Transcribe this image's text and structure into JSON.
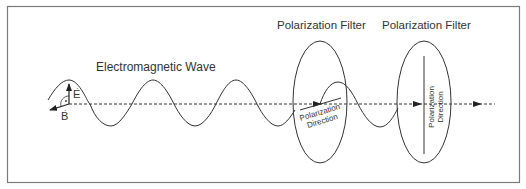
{
  "diagram": {
    "title": "Electromagnetic Wave",
    "vectors": {
      "electric": "E",
      "magnetic": "B"
    },
    "filters": [
      {
        "label": "Polarization Filter",
        "direction_label_line1": "Polarization",
        "direction_label_line2": "Direction",
        "orientation": "near-horizontal (tilted)"
      },
      {
        "label": "Polarization Filter",
        "direction_label_line1": "Polarization",
        "direction_label_line2": "Direction",
        "orientation": "vertical"
      }
    ],
    "colors": {
      "stroke": "#333333",
      "border": "#7a7a7a",
      "background": "#ffffff"
    }
  }
}
